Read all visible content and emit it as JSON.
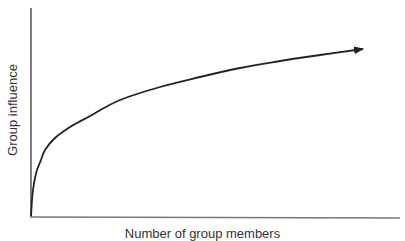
{
  "chart_data": {
    "type": "line",
    "title": "",
    "xlabel": "Number of group members",
    "ylabel": "Group influence",
    "grid": false,
    "legend": null,
    "axis_ticks": false,
    "annotations": [
      "arrowhead at end of curve indicating continuation"
    ],
    "series": [
      {
        "name": "Group influence",
        "points_px": [
          [
            31,
            216
          ],
          [
            32,
            200
          ],
          [
            33,
            190
          ],
          [
            35,
            178
          ],
          [
            37,
            170
          ],
          [
            41,
            160
          ],
          [
            45,
            150
          ],
          [
            55,
            138
          ],
          [
            70,
            127
          ],
          [
            90,
            116
          ],
          [
            120,
            100
          ],
          [
            160,
            87
          ],
          [
            200,
            77
          ],
          [
            240,
            68
          ],
          [
            280,
            61
          ],
          [
            320,
            55
          ],
          [
            363,
            49
          ]
        ],
        "color": "#222222"
      }
    ],
    "x_relative": [
      0,
      0.2,
      0.5,
      1.0,
      2.0,
      3.0,
      4.0,
      6.5,
      11.5,
      18,
      27.5,
      40,
      53,
      66,
      79,
      92,
      100
    ],
    "y_relative": [
      0,
      9.4,
      15.6,
      23.1,
      28.1,
      34.4,
      40.6,
      48.1,
      55.0,
      61.9,
      71.9,
      80.0,
      86.3,
      91.9,
      96.3,
      100,
      103.8
    ]
  },
  "axes": {
    "origin": [
      31,
      216
    ],
    "x_end": 400,
    "y_top": 8
  },
  "colors": {
    "line": "#222222",
    "axis": "#555555",
    "text": "#333333"
  }
}
